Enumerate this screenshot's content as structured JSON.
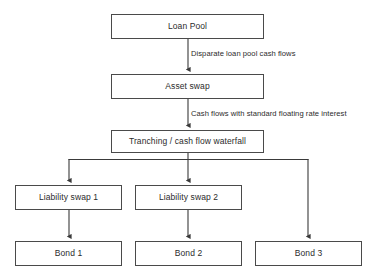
{
  "diagram": {
    "type": "flowchart",
    "canvas": {
      "width": 378,
      "height": 274,
      "background": "#ffffff"
    },
    "style": {
      "box_border_color": "#4a4a4a",
      "box_fill_color": "#ffffff",
      "text_color": "#2b2b2b",
      "connector_color": "#3a3a3a"
    },
    "nodes": [
      {
        "id": "loan-pool",
        "label": "Loan Pool",
        "x": 111,
        "y": 14,
        "w": 153,
        "h": 25
      },
      {
        "id": "asset-swap",
        "label": "Asset swap",
        "x": 111,
        "y": 74,
        "w": 153,
        "h": 25
      },
      {
        "id": "tranching",
        "label": "Tranching / cash flow waterfall",
        "x": 111,
        "y": 130,
        "w": 153,
        "h": 23
      },
      {
        "id": "liab-swap-1",
        "label": "Liability swap 1",
        "x": 15,
        "y": 185,
        "w": 107,
        "h": 25
      },
      {
        "id": "liab-swap-2",
        "label": "Liability swap 2",
        "x": 135,
        "y": 185,
        "w": 107,
        "h": 25
      },
      {
        "id": "bond-1",
        "label": "Bond 1",
        "x": 15,
        "y": 241,
        "w": 107,
        "h": 25
      },
      {
        "id": "bond-2",
        "label": "Bond 2",
        "x": 135,
        "y": 241,
        "w": 107,
        "h": 25
      },
      {
        "id": "bond-3",
        "label": "Bond 3",
        "x": 255,
        "y": 241,
        "w": 107,
        "h": 25
      }
    ],
    "edge_labels": [
      {
        "id": "label-disparate",
        "text": "Disparate loan pool cash flows",
        "x": 191,
        "y": 50
      },
      {
        "id": "label-standard",
        "text": "Cash flows with standard floating rate interest",
        "x": 191,
        "y": 110
      }
    ],
    "edges": [
      {
        "from": "loan-pool",
        "to": "asset-swap",
        "label": "Disparate loan pool cash flows"
      },
      {
        "from": "asset-swap",
        "to": "tranching",
        "label": "Cash flows with standard floating rate interest"
      },
      {
        "from": "tranching",
        "to": "liab-swap-1",
        "label": ""
      },
      {
        "from": "tranching",
        "to": "liab-swap-2",
        "label": ""
      },
      {
        "from": "tranching",
        "to": "bond-3",
        "label": ""
      },
      {
        "from": "liab-swap-1",
        "to": "bond-1",
        "label": ""
      },
      {
        "from": "liab-swap-2",
        "to": "bond-2",
        "label": ""
      }
    ]
  }
}
